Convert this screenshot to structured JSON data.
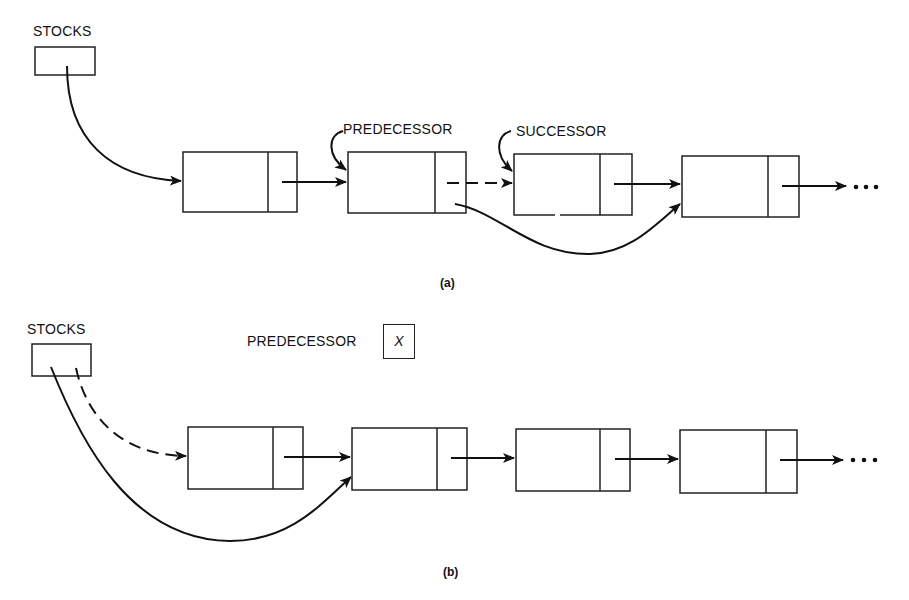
{
  "figure": {
    "part_a": {
      "caption": "(a)",
      "labels": {
        "head": "STOCKS",
        "predecessor": "PREDECESSOR",
        "successor": "SUCCESSOR"
      },
      "nodes": 4,
      "continuation": "• • •",
      "description": "Linked list from STOCKS; PREDECESSOR node's link is rerouted (dashed old link to SUCCESSOR) to bypass SUCCESSOR and point to the following node."
    },
    "part_b": {
      "caption": "(b)",
      "labels": {
        "head": "STOCKS",
        "predecessor": "PREDECESSOR",
        "predecessor_value": "X"
      },
      "nodes": 4,
      "continuation": "• • •",
      "description": "Deleting first node: STOCKS head pointer (dashed old link to first node) rerouted to second node; PREDECESSOR is undefined (X)."
    },
    "colors": {
      "ink": "#111111",
      "background": "#ffffff"
    }
  }
}
